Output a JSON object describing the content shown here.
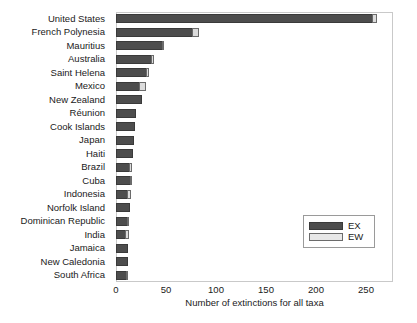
{
  "chart_data": {
    "type": "bar",
    "orientation": "horizontal",
    "stacked": true,
    "title": "",
    "xlabel": "Number of extinctions for all taxa",
    "ylabel": "",
    "xlim": [
      0,
      277
    ],
    "xticks": [
      0,
      50,
      100,
      150,
      200,
      250
    ],
    "grid": false,
    "legend_position": "right-lower",
    "categories": [
      "United States",
      "French Polynesia",
      "Mauritius",
      "Australia",
      "Saint Helena",
      "Mexico",
      "New Zealand",
      "Réunion",
      "Cook Islands",
      "Japan",
      "Haiti",
      "Brazil",
      "Cuba",
      "Indonesia",
      "Norfolk Island",
      "Dominican Republic",
      "India",
      "Jamaica",
      "New Caledonia",
      "South Africa"
    ],
    "series": [
      {
        "name": "EX",
        "color": "#4d4d4d",
        "values": [
          257,
          77,
          47,
          36,
          31,
          24,
          26,
          20,
          19,
          18,
          17,
          14,
          15,
          12,
          14,
          12,
          10,
          12,
          12,
          11
        ]
      },
      {
        "name": "EW",
        "color": "#dcdcdc",
        "values": [
          5,
          7,
          1,
          3,
          3,
          7,
          0,
          0,
          0,
          0,
          0,
          3,
          1,
          4,
          0,
          1,
          4,
          0,
          0,
          2
        ]
      }
    ]
  },
  "legend": {
    "entries": [
      {
        "label": "EX",
        "swatch": "ex"
      },
      {
        "label": "EW",
        "swatch": "ew"
      }
    ]
  }
}
